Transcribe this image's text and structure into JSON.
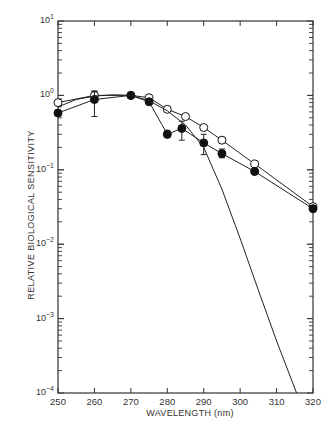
{
  "chart_data": {
    "type": "line",
    "title": "",
    "xlabel": "WAVELENGTH (nm)",
    "ylabel": "RELATIVE BIOLOGICAL SENSITIVITY",
    "yscale": "log",
    "xlim": [
      250,
      320
    ],
    "ylim": [
      0.0001,
      10
    ],
    "x_ticks": [
      250,
      260,
      270,
      280,
      290,
      300,
      310,
      320
    ],
    "y_ticks": [
      {
        "value": 10,
        "label_base": "10",
        "label_exp": "1"
      },
      {
        "value": 1,
        "label_base": "10",
        "label_exp": "0"
      },
      {
        "value": 0.1,
        "label_base": "10",
        "label_exp": "−1"
      },
      {
        "value": 0.01,
        "label_base": "10",
        "label_exp": "−2"
      },
      {
        "value": 0.001,
        "label_base": "10",
        "label_exp": "−3"
      },
      {
        "value": 0.0001,
        "label_base": "10",
        "label_exp": "−4"
      }
    ],
    "grid": false,
    "legend": null,
    "series": [
      {
        "name": "open circles",
        "marker": "open-circle",
        "x": [
          250,
          260,
          270,
          275,
          280,
          285,
          290,
          295,
          304,
          320
        ],
        "y": [
          0.8,
          1.0,
          1.0,
          0.93,
          0.65,
          0.52,
          0.37,
          0.25,
          0.12,
          0.032
        ],
        "error_bars": [
          {
            "x": 260,
            "low": 0.9,
            "high": 1.15
          }
        ]
      },
      {
        "name": "filled circles",
        "marker": "filled-circle",
        "x": [
          250,
          260,
          270,
          275,
          280,
          284,
          290,
          295,
          304,
          320
        ],
        "y": [
          0.58,
          0.88,
          1.0,
          0.82,
          0.3,
          0.36,
          0.23,
          0.165,
          0.095,
          0.03
        ],
        "error_bars": [
          {
            "x": 260,
            "low": 0.52,
            "high": 1.12
          },
          {
            "x": 280,
            "low": 0.27,
            "high": 0.34
          },
          {
            "x": 284,
            "low": 0.25,
            "high": 0.45
          },
          {
            "x": 290,
            "low": 0.16,
            "high": 0.3
          },
          {
            "x": 295,
            "low": 0.145,
            "high": 0.19
          },
          {
            "x": 304,
            "low": 0.088,
            "high": 0.105
          }
        ]
      },
      {
        "name": "action spectrum curve",
        "marker": "none",
        "x": [
          250,
          255,
          260,
          265,
          270,
          275,
          280,
          285,
          290,
          295,
          300,
          305,
          310,
          315.5
        ],
        "y": [
          0.7,
          0.88,
          0.98,
          1.02,
          1.0,
          0.85,
          0.62,
          0.4,
          0.2,
          0.055,
          0.012,
          0.0024,
          0.0005,
          0.0001
        ]
      }
    ]
  }
}
